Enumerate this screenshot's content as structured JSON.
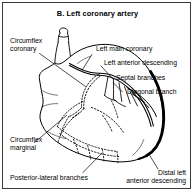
{
  "figure": {
    "title": "B. Left coronary artery",
    "panel_border_color": "#3a3a3a",
    "background_color": "#ffffff",
    "ink_color": "#000000",
    "highlight_vessel_color": "#000000"
  },
  "labels": {
    "circumflex_coronary": "Circumflex\ncoronary",
    "circumflex_coronary_line1": "Circumflex",
    "circumflex_coronary_line2": "coronary",
    "circumflex_marginal_line1": "Circumflex",
    "circumflex_marginal_line2": "marginal",
    "posterior_lateral_branches": "Posterior-lateral branches",
    "left_main_coronary": "Left main coronary",
    "left_anterior_descending": "Left anterior descending",
    "septal_branches": "Septal branches",
    "diagonal_branch": "Diagonal branch",
    "distal_left_line1": "Distal left",
    "distal_left_line2": "anterior descending"
  },
  "diagram_elements": {
    "aorta": "aorta-outline",
    "heart_body": "heart-ventricle-outline",
    "left_main": "left-main-coronary-artery",
    "lad": "left-anterior-descending-artery",
    "distal_lad": "distal-left-anterior-descending-artery",
    "septal": "septal-branches-vessels",
    "diagonal": "diagonal-branch-vessel",
    "circumflex": "circumflex-artery-hidden",
    "marginal": "circumflex-marginal-hidden",
    "posterior_lateral": "posterior-lateral-branches-hidden"
  }
}
